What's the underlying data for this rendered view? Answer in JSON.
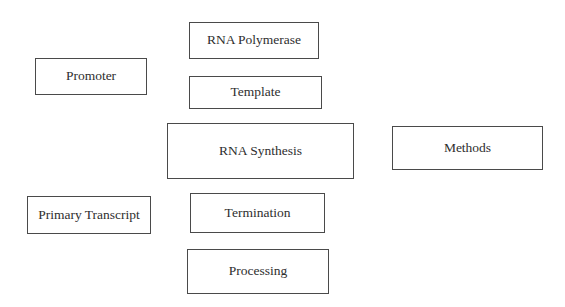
{
  "diagram": {
    "type": "concept-boxes",
    "background_color": "#ffffff",
    "border_color": "#4a4a4a",
    "text_color": "#2e2e2e",
    "nodes": [
      {
        "id": "rna-polymerase",
        "label": "RNA Polymerase"
      },
      {
        "id": "template",
        "label": "Template"
      },
      {
        "id": "promoter",
        "label": "Promoter"
      },
      {
        "id": "rna-synthesis",
        "label": "RNA Synthesis"
      },
      {
        "id": "methods",
        "label": "Methods"
      },
      {
        "id": "primary-transcript",
        "label": "Primary Transcript"
      },
      {
        "id": "termination",
        "label": "Termination"
      },
      {
        "id": "processing",
        "label": "Processing"
      }
    ],
    "edges": []
  }
}
